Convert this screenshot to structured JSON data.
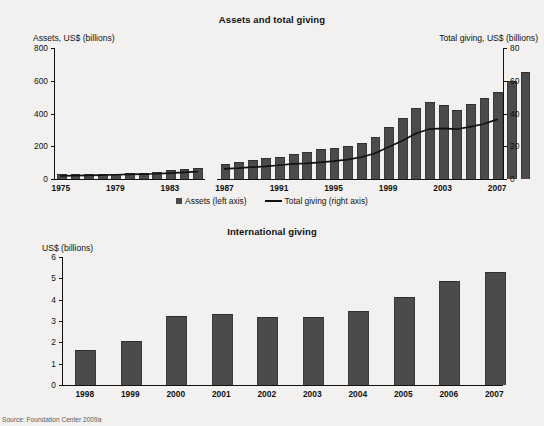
{
  "source_note": "Source: Foundation Center 2009a",
  "colors": {
    "bar": "#4b4b4b",
    "line": "#111111",
    "background": "#f2f1ef",
    "text": "#111111"
  },
  "chart_data": [
    {
      "type": "bar",
      "id": "assets-and-total-giving",
      "title": "Assets and total giving",
      "xlabel": "",
      "ylabel": "Assets, US$ (billions)",
      "y2label": "Total giving, US$ (billions)",
      "ylim": [
        0,
        800
      ],
      "y2lim": [
        0,
        80
      ],
      "yticks": [
        "0",
        "200",
        "400",
        "600",
        "800"
      ],
      "ytick_values": [
        0,
        200,
        400,
        600,
        800
      ],
      "y2ticks": [
        "0",
        "20",
        "40",
        "60",
        "80"
      ],
      "y2tick_values": [
        0,
        20,
        40,
        60,
        80
      ],
      "grid": false,
      "legend_position": "bottom",
      "legend": [
        {
          "label": "Assets (left axis)",
          "marker": "square"
        },
        {
          "label": "Total giving (right axis)",
          "marker": "line"
        }
      ],
      "categories": [
        "1975",
        "1976",
        "1977",
        "1978",
        "1979",
        "1980",
        "1981",
        "1982",
        "1983",
        "1984",
        "1985",
        "1987",
        "1988",
        "1989",
        "1990",
        "1991",
        "1992",
        "1993",
        "1994",
        "1995",
        "1996",
        "1997",
        "1998",
        "1999",
        "2000",
        "2001",
        "2002",
        "2003",
        "2004",
        "2005",
        "2006",
        "2007"
      ],
      "xtick_labels": [
        "1975",
        "1979",
        "1983",
        "1987",
        "1991",
        "1995",
        "1999",
        "2003",
        "2007"
      ],
      "series": [
        {
          "name": "Assets (left axis)",
          "axis": "left",
          "type": "bar",
          "values": [
            23,
            24,
            25,
            25,
            27,
            30,
            32,
            39,
            47,
            54,
            62,
            88,
            99,
            108,
            123,
            126,
            147,
            158,
            176,
            181,
            196,
            211,
            250,
            311,
            368,
            430,
            465,
            445,
            415,
            455,
            486,
            524,
            592,
            645
          ]
        },
        {
          "name": "Total giving (right axis)",
          "axis": "right",
          "type": "line",
          "values": [
            1.9,
            2.1,
            2.2,
            2.4,
            2.6,
            2.8,
            3.0,
            3.2,
            3.6,
            4.0,
            4.5,
            6.2,
            6.6,
            7.2,
            7.7,
            8.4,
            9.2,
            9.6,
            10.2,
            10.9,
            11.8,
            13.3,
            15.6,
            19.4,
            23.2,
            27.6,
            30.5,
            30.9,
            30.4,
            31.8,
            33.6,
            36.4,
            39.0,
            42.9
          ]
        }
      ],
      "break_after_category": "1985"
    },
    {
      "type": "bar",
      "id": "international-giving",
      "title": "International giving",
      "xlabel": "",
      "ylabel": "US$ (billions)",
      "ylim": [
        0,
        6
      ],
      "yticks": [
        "0",
        "1",
        "2",
        "3",
        "4",
        "5",
        "6"
      ],
      "ytick_values": [
        0,
        1,
        2,
        3,
        4,
        5,
        6
      ],
      "grid": false,
      "legend_position": "none",
      "categories": [
        "1998",
        "1999",
        "2000",
        "2001",
        "2002",
        "2003",
        "2004",
        "2005",
        "2006",
        "2007"
      ],
      "values": [
        1.6,
        2.0,
        3.2,
        3.3,
        3.15,
        3.12,
        3.42,
        4.1,
        4.85,
        5.25
      ]
    }
  ]
}
